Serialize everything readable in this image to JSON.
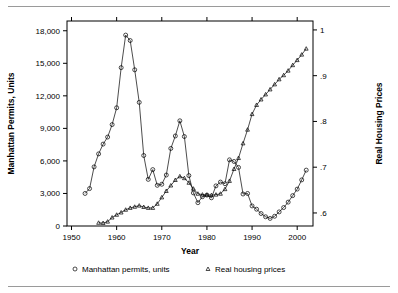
{
  "figure": {
    "background": "#ffffff",
    "ink": "#000000",
    "rule_color": "#9a9a9a",
    "has_top_rule": true,
    "has_bottom_rule": true
  },
  "chart_data": {
    "type": "line",
    "title": "",
    "subtitle": "",
    "xlabel": "Year",
    "ylabel": "Manhattan Permits, Units",
    "y2label": "Real Housing Prices",
    "xlim": [
      1949,
      2003.5
    ],
    "ylim": [
      0,
      18900
    ],
    "y2lim": [
      0.5715,
      1.0195
    ],
    "grid": false,
    "legend_position": "bottom",
    "xticks": [
      1950,
      1960,
      1970,
      1980,
      1990,
      2000
    ],
    "xticklabels": [
      "1950",
      "1960",
      "1970",
      "1980",
      "1990",
      "2000"
    ],
    "yticks": [
      0,
      3000,
      6000,
      9000,
      12000,
      15000,
      18000
    ],
    "yticklabels": [
      "0",
      "3,000",
      "6,000",
      "9,000",
      "12,000",
      "15,000",
      "18,000"
    ],
    "y2ticks": [
      0.6,
      0.7,
      0.8,
      0.9,
      1.0
    ],
    "y2ticklabels": [
      ".6",
      ".7",
      ".8",
      ".9",
      "1"
    ],
    "series": [
      {
        "name": "Manhattan permits, units",
        "marker": "circle",
        "axis": "left",
        "x": [
          1953,
          1954,
          1955,
          1956,
          1957,
          1958,
          1959,
          1960,
          1961,
          1962,
          1963,
          1964,
          1965,
          1966,
          1967,
          1968,
          1969,
          1970,
          1971,
          1972,
          1973,
          1974,
          1975,
          1976,
          1977,
          1978,
          1979,
          1980,
          1981,
          1982,
          1983,
          1984,
          1985,
          1986,
          1987,
          1988,
          1989,
          1990,
          1991,
          1992,
          1993,
          1994,
          1995,
          1996,
          1997,
          1998,
          1999,
          2000,
          2001,
          2002
        ],
        "values": [
          3000,
          3450,
          5450,
          6650,
          7550,
          8200,
          9350,
          10900,
          14600,
          17600,
          17100,
          14400,
          11400,
          6500,
          4300,
          5200,
          3750,
          3850,
          4700,
          7150,
          8300,
          9700,
          8250,
          4650,
          3050,
          2150,
          2700,
          2850,
          2600,
          3700,
          4050,
          3900,
          6100,
          5950,
          5400,
          2950,
          3000,
          1850,
          1550,
          1150,
          850,
          700,
          900,
          1300,
          1700,
          2200,
          2800,
          3400,
          4250,
          5150
        ]
      },
      {
        "name": "Real housing prices",
        "marker": "triangle",
        "axis": "right",
        "x": [
          1956,
          1957,
          1958,
          1959,
          1960,
          1961,
          1962,
          1963,
          1964,
          1965,
          1966,
          1967,
          1968,
          1969,
          1970,
          1971,
          1972,
          1973,
          1974,
          1975,
          1976,
          1977,
          1978,
          1979,
          1980,
          1981,
          1982,
          1983,
          1984,
          1985,
          1986,
          1987,
          1988,
          1989,
          1990,
          1991,
          1992,
          1993,
          1994,
          1995,
          1996,
          1997,
          1998,
          1999,
          2000,
          2001,
          2002
        ],
        "values": [
          0.5785,
          0.578,
          0.581,
          0.59,
          0.596,
          0.601,
          0.607,
          0.611,
          0.6135,
          0.616,
          0.613,
          0.611,
          0.611,
          0.62,
          0.634,
          0.648,
          0.66,
          0.672,
          0.68,
          0.676,
          0.666,
          0.653,
          0.642,
          0.64,
          0.6395,
          0.639,
          0.64,
          0.642,
          0.652,
          0.67,
          0.696,
          0.72,
          0.752,
          0.782,
          0.816,
          0.836,
          0.848,
          0.859,
          0.87,
          0.881,
          0.892,
          0.901,
          0.911,
          0.923,
          0.934,
          0.946,
          0.959
        ]
      }
    ],
    "annotations": []
  },
  "legend": {
    "items": [
      {
        "marker": "circle",
        "label": "Manhattan permits, units"
      },
      {
        "marker": "triangle",
        "label": "Real housing prices"
      }
    ]
  }
}
